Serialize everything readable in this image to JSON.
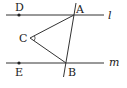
{
  "diagram": {
    "type": "geometry",
    "colors": {
      "stroke": "#333333",
      "text": "#222222",
      "background": "#ffffff"
    },
    "lines": [
      {
        "name": "l",
        "label": "l",
        "from": [
          6,
          15
        ],
        "to": [
          104,
          15
        ]
      },
      {
        "name": "m",
        "label": "m",
        "from": [
          6,
          63
        ],
        "to": [
          104,
          63
        ]
      },
      {
        "name": "transversal",
        "label": "",
        "from": [
          76,
          3
        ],
        "to": [
          63.5,
          77
        ]
      }
    ],
    "segments": [
      {
        "name": "CA",
        "from": "C",
        "to": "A"
      },
      {
        "name": "CB",
        "from": "C",
        "to": "B"
      }
    ],
    "points": {
      "A": {
        "label": "A",
        "x": 74,
        "y": 15
      },
      "B": {
        "label": "B",
        "x": 66,
        "y": 63
      },
      "C": {
        "label": "C",
        "x": 30,
        "y": 38
      },
      "D": {
        "label": "D",
        "x": 19,
        "y": 15
      },
      "E": {
        "label": "E",
        "x": 19,
        "y": 63
      }
    },
    "angle_marks": [
      {
        "at": "C",
        "between": [
          "A",
          "B"
        ]
      }
    ],
    "labels": {
      "A": "A",
      "B": "B",
      "C": "C",
      "D": "D",
      "E": "E",
      "l": "l",
      "m": "m"
    }
  }
}
